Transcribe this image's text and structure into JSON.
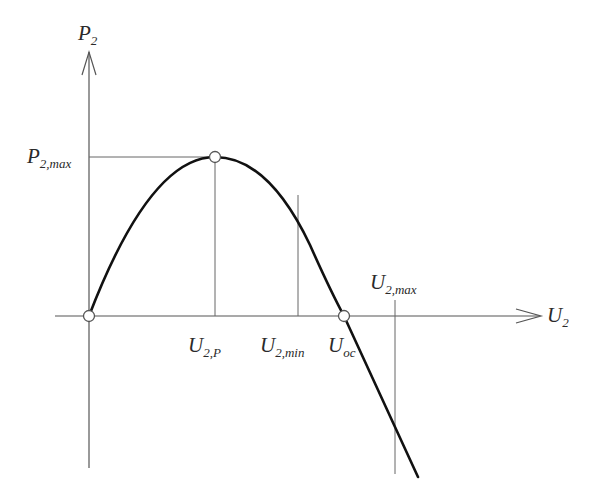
{
  "diagram": {
    "axes": {
      "x_label": {
        "main": "U",
        "sub": "2"
      },
      "y_label": {
        "main": "P",
        "sub": "2"
      }
    },
    "labels": {
      "p2max": {
        "main": "P",
        "sub": "2,max"
      },
      "u2p": {
        "main": "U",
        "sub": "2,P"
      },
      "u2min": {
        "main": "U",
        "sub": "2,min"
      },
      "uoc": {
        "main": "U",
        "sub": "oc"
      },
      "u2max": {
        "main": "U",
        "sub": "2,max"
      }
    },
    "points": [
      {
        "name": "origin",
        "x": 89,
        "y": 316
      },
      {
        "name": "max-power-point",
        "x": 215,
        "y": 157
      },
      {
        "name": "open-circuit-point",
        "x": 344,
        "y": 316
      }
    ],
    "colors": {
      "curve": "#111111",
      "axis": "#555555",
      "guide": "#666666",
      "marker_fill": "#ffffff",
      "marker_stroke": "#555555"
    }
  }
}
